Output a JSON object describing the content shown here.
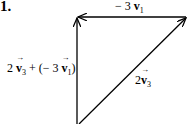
{
  "problem_number": "1.",
  "labels": {
    "top": {
      "coef": "− 3",
      "vec": "v",
      "sub": "1"
    },
    "left": {
      "coef1": "2",
      "vec1": "v",
      "sub1": "3",
      "mid": " + (− 3",
      "vec2": "v",
      "sub2": "1",
      "end": ")"
    },
    "diag": {
      "coef": "2",
      "vec": "v",
      "sub": "3"
    }
  },
  "colors": {
    "stroke": "#000000",
    "background": "#ffffff"
  }
}
